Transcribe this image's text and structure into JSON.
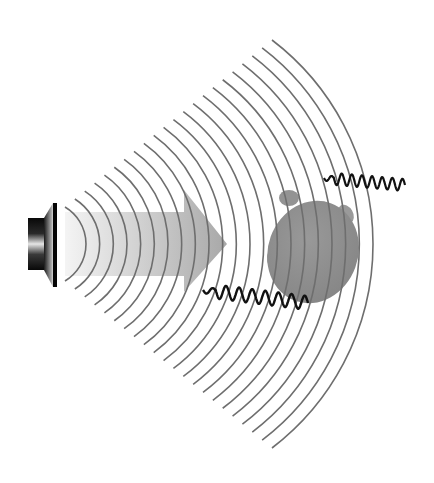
{
  "figure": {
    "components": {
      "speaker": "speaker-icon",
      "arrow": "direction-arrow",
      "waves": "sound-wave-arcs",
      "turtle": "turtle-silhouette",
      "signals": [
        "wavy-signal-top",
        "wavy-signal-bottom"
      ]
    }
  },
  "geometry": {
    "arc_count": 22,
    "center_y": 244,
    "inner_arc": {
      "apex_x": 86,
      "end_x": 65,
      "half_height": 37
    },
    "outer_arc": {
      "apex_x": 373,
      "end_x": 272,
      "half_height": 204
    },
    "speaker": {
      "box": [
        28,
        218,
        16,
        52
      ],
      "cone": [
        44,
        203,
        56,
        287
      ]
    },
    "arrow": {
      "shaft_x0": 65,
      "shaft_x1": 184,
      "shaft_top": 212,
      "shaft_bottom": 276,
      "head_top": 190,
      "head_bottom": 292,
      "tip_x": 227
    },
    "turtle": {
      "cx": 313,
      "cy": 252,
      "rx": 45,
      "ry": 52
    },
    "wave_top": {
      "x0": 324,
      "y0": 178,
      "x1": 405,
      "y1": 185,
      "cycles": 8
    },
    "wave_bottom": {
      "x0": 203,
      "y0": 290,
      "x1": 308,
      "y1": 303,
      "cycles": 8
    }
  },
  "colors": {
    "background": "#ffffff",
    "arc": "#6e6e6e",
    "arrow_light": "#f2f2f2",
    "arrow_dark": "#a9a9a9",
    "turtle": "#8f8f8f",
    "turtle_flipper": "#9a9a9a",
    "signal": "#111111",
    "speaker_dark": "#0a0a0a",
    "speaker_light": "#e8e8e8"
  }
}
